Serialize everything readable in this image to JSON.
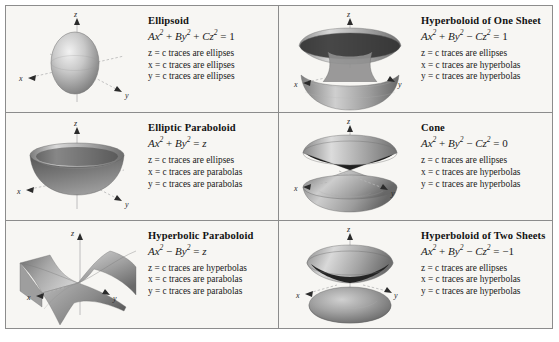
{
  "table": {
    "name": "quadric-surfaces-reference-table",
    "columns": 2,
    "rows": 3,
    "background_color": "#f7f6f3",
    "border_color": "#8c8c8c"
  },
  "axis_labels": {
    "x": "x",
    "y": "y",
    "z": "z"
  },
  "surfaces": [
    {
      "id": "ellipsoid",
      "title": "Ellipsoid",
      "equation": {
        "terms": [
          "Ax",
          "By",
          "Cz"
        ],
        "signs": [
          "+",
          "+"
        ],
        "rhs": "1"
      },
      "equation_text": "Ax² + By² + Cz² = 1",
      "traces": [
        "z = c traces are ellipses",
        "x = c traces are ellipses",
        "y = c traces are ellipses"
      ]
    },
    {
      "id": "hyperboloid-of-one-sheet",
      "title": "Hyperboloid of One Sheet",
      "equation": {
        "terms": [
          "Ax",
          "By",
          "Cz"
        ],
        "signs": [
          "+",
          "−"
        ],
        "rhs": "1"
      },
      "equation_text": "Ax² + By² − Cz² = 1",
      "traces": [
        "z = c traces are ellipses",
        "x = c traces are hyperbolas",
        "y = c traces are hyperbolas"
      ]
    },
    {
      "id": "elliptic-paraboloid",
      "title": "Elliptic Paraboloid",
      "equation": {
        "terms": [
          "Ax",
          "By"
        ],
        "signs": [
          "+"
        ],
        "rhs": "z"
      },
      "equation_text": "Ax² + By² = z",
      "traces": [
        "z = c traces are ellipses",
        "x = c traces are parabolas",
        "y = c traces are parabolas"
      ]
    },
    {
      "id": "cone",
      "title": "Cone",
      "equation": {
        "terms": [
          "Ax",
          "By",
          "Cz"
        ],
        "signs": [
          "+",
          "−"
        ],
        "rhs": "0"
      },
      "equation_text": "Ax² + By² − Cz² = 0",
      "traces": [
        "z = c traces are ellipses",
        "x = c traces are hyperbolas",
        "y = c traces are hyperbolas"
      ]
    },
    {
      "id": "hyperbolic-paraboloid",
      "title": "Hyperbolic Paraboloid",
      "equation": {
        "terms": [
          "Ax",
          "By"
        ],
        "signs": [
          "−"
        ],
        "rhs": "z"
      },
      "equation_text": "Ax² − By² = z",
      "traces": [
        "z = c traces are hyperbolas",
        "x = c traces are parabolas",
        "y = c traces are parabolas"
      ]
    },
    {
      "id": "hyperboloid-of-two-sheets",
      "title": "Hyperboloid of Two Sheets",
      "equation": {
        "terms": [
          "Ax",
          "By",
          "Cz"
        ],
        "signs": [
          "+",
          "−"
        ],
        "rhs": "−1"
      },
      "equation_text": "Ax² + By² − Cz² = −1",
      "traces": [
        "z = c traces are ellipses",
        "x = c traces are hyperbolas",
        "y = c traces are hyperbolas"
      ]
    }
  ]
}
